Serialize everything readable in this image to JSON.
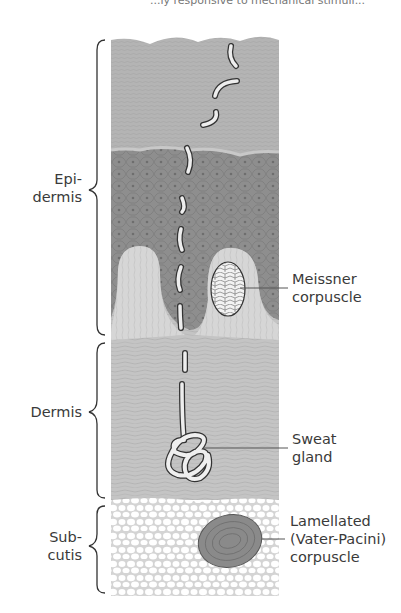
{
  "figure": {
    "header_fragment": "...ly responsive to mechanical stimuli...",
    "layers": [
      {
        "name": "Epidermis",
        "label_line1": "Epi-",
        "label_line2": "dermis"
      },
      {
        "name": "Dermis",
        "label_line1": "Dermis"
      },
      {
        "name": "Subcutis",
        "label_line1": "Sub-",
        "label_line2": "cutis"
      }
    ],
    "structures": [
      {
        "name": "Meissner corpuscle",
        "label_line1": "Meissner",
        "label_line2": "corpuscle"
      },
      {
        "name": "Sweat gland",
        "label_line1": "Sweat",
        "label_line2": "gland"
      },
      {
        "name": "Lamellated corpuscle",
        "label_line1": "Lamellated",
        "label_line2": "(Vater-Pacini)",
        "label_line3": "corpuscle"
      }
    ],
    "colors": {
      "stratum_corneum": "#b4b4b4",
      "epidermis_cells": "#8e8e8e",
      "dermis": "#c4c4c4",
      "papillae": "#d6d6d6",
      "subcutis": "#ececec",
      "fat_cells": "#ffffff",
      "pacini": "#8a8a8a",
      "line": "#333333"
    }
  }
}
